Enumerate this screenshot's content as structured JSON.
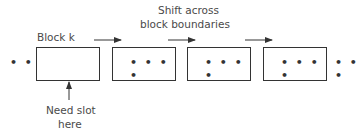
{
  "diagram": {
    "title_line1": "Shift across",
    "title_line2": "block boundaries",
    "block_label": "Block k",
    "need_slot_line1": "Need slot",
    "need_slot_line2": "here",
    "left_ellipsis": "• • •",
    "right_ellipsis": "• • •",
    "blocks": [
      {
        "name": "block-k",
        "content": ""
      },
      {
        "name": "block-2",
        "content": "• • • •"
      },
      {
        "name": "block-3",
        "content": "• • • •"
      },
      {
        "name": "block-4",
        "content": "• • • •"
      }
    ],
    "colors": {
      "stroke": "#333333",
      "text": "#4a4a4a",
      "background": "#ffffff"
    }
  }
}
